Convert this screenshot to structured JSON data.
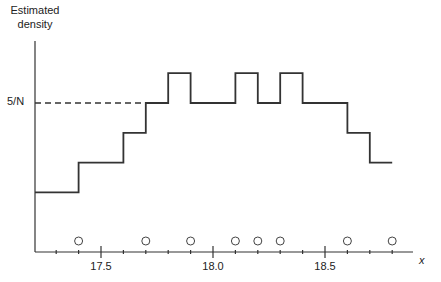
{
  "chart_data": {
    "type": "line",
    "subtype": "step-histogram",
    "title": "",
    "ylabel": "Estimated density",
    "xlabel": "x",
    "reference_line": {
      "label": "5/N",
      "value": 5,
      "style": "dashed"
    },
    "x_tick_labels": [
      "17.5",
      "18.0",
      "18.5"
    ],
    "x_major_ticks": [
      17.5,
      18.0,
      18.5
    ],
    "x_minor_tick_step": 0.1,
    "xlim": [
      17.2,
      18.9
    ],
    "ylim": [
      0,
      7
    ],
    "y_units": "1/N",
    "steps": [
      {
        "x0": 17.2,
        "x1": 17.4,
        "y": 2
      },
      {
        "x0": 17.4,
        "x1": 17.6,
        "y": 3
      },
      {
        "x0": 17.6,
        "x1": 17.7,
        "y": 4
      },
      {
        "x0": 17.7,
        "x1": 17.8,
        "y": 5
      },
      {
        "x0": 17.8,
        "x1": 17.9,
        "y": 6
      },
      {
        "x0": 17.9,
        "x1": 18.1,
        "y": 5
      },
      {
        "x0": 18.1,
        "x1": 18.2,
        "y": 6
      },
      {
        "x0": 18.2,
        "x1": 18.3,
        "y": 5
      },
      {
        "x0": 18.3,
        "x1": 18.4,
        "y": 6
      },
      {
        "x0": 18.4,
        "x1": 18.6,
        "y": 5
      },
      {
        "x0": 18.6,
        "x1": 18.7,
        "y": 4
      },
      {
        "x0": 18.7,
        "x1": 18.8,
        "y": 3
      }
    ],
    "data_points": [
      17.4,
      17.7,
      17.9,
      18.1,
      18.2,
      18.3,
      18.6,
      18.8
    ],
    "data_point_marker": "open-circle",
    "grid": false,
    "legend": null
  },
  "labels": {
    "ylabel_line1": "Estimated",
    "ylabel_line2": "density",
    "ref": "5/N",
    "tick_175": "17.5",
    "tick_180": "18.0",
    "tick_185": "18.5",
    "xlabel": "x"
  }
}
